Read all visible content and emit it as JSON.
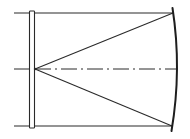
{
  "diagram": {
    "type": "technical-drawing",
    "elements": [
      {
        "name": "top-boundary-line",
        "kind": "solid-line"
      },
      {
        "name": "bottom-boundary-line",
        "kind": "solid-line"
      },
      {
        "name": "plate",
        "kind": "thin-rectangle"
      },
      {
        "name": "centerline",
        "kind": "dash-dot-line"
      },
      {
        "name": "upper-ray",
        "kind": "solid-line"
      },
      {
        "name": "lower-ray",
        "kind": "solid-line"
      },
      {
        "name": "curved-surface",
        "kind": "arc"
      }
    ],
    "colors": {
      "stroke": "#2a2a2a",
      "background": "#ffffff"
    }
  }
}
